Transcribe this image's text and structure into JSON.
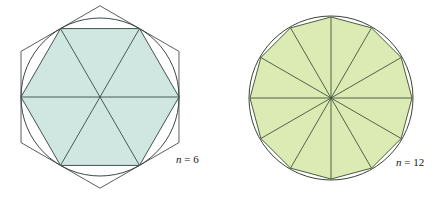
{
  "figure": {
    "caption_left": "n = 6",
    "caption_right": "n = 12",
    "background_color": "#ffffff"
  },
  "panels": [
    {
      "id": "hexagon-panel",
      "label": "n = 6",
      "label_variable": "n",
      "label_operator": "=",
      "label_value": "6",
      "sides": 6,
      "center_x": 100,
      "center_y": 97,
      "inscribed_radius": 79,
      "circle_radius": 79,
      "circumscribed_radius": 91.2,
      "fill_color": "#cfe7e0",
      "stroke_color": "#3a4a46",
      "circle_stroke_color": "#2f3f3b",
      "outer_stroke_color": "#4a4a48",
      "radii_count": 6,
      "start_angle_deg": 0,
      "outer_start_angle_deg": 30
    },
    {
      "id": "dodecagon-panel",
      "label": "n = 12",
      "label_variable": "n",
      "label_operator": "=",
      "label_value": "12",
      "sides": 12,
      "center_x": 331,
      "center_y": 98,
      "inscribed_radius": 81,
      "circle_radius": 82,
      "fill_color": "#dcebb4",
      "stroke_color": "#44523a",
      "circle_stroke_color": "#2e3a28",
      "radii_count": 12,
      "start_angle_deg": 0
    }
  ],
  "label_positions": {
    "left_label_x": 176,
    "left_label_y": 163,
    "right_label_x": 396,
    "right_label_y": 166
  }
}
